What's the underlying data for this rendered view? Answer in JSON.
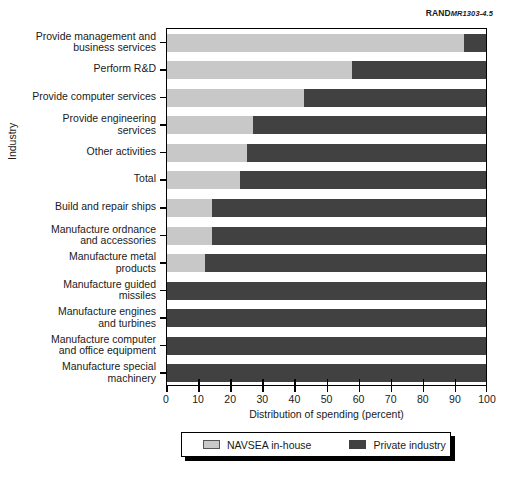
{
  "source_credit": {
    "publisher": "RAND",
    "document_id": "MR1303-4.5"
  },
  "chart_data": {
    "type": "bar",
    "orientation": "horizontal",
    "stacked": true,
    "title": "",
    "xlabel": "Distribution of spending (percent)",
    "ylabel": "Industry",
    "xlim": [
      0,
      100
    ],
    "xticks": [
      0,
      10,
      20,
      30,
      40,
      50,
      60,
      70,
      80,
      90,
      100
    ],
    "grid": false,
    "legend_position": "bottom",
    "categories": [
      "Provide management and business services",
      "Perform R&D",
      "Provide computer services",
      "Provide engineering services",
      "Other activities",
      "Total",
      "Build and repair ships",
      "Manufacture ordnance and accessories",
      "Manufacture metal products",
      "Manufacture guided missiles",
      "Manufacture engines and turbines",
      "Manufacture computer and office equipment",
      "Manufacture special machinery"
    ],
    "category_lines": [
      [
        "Provide management and",
        "business services"
      ],
      [
        "Perform R&D"
      ],
      [
        "Provide computer services"
      ],
      [
        "Provide engineering",
        "services"
      ],
      [
        "Other activities"
      ],
      [
        "Total"
      ],
      [
        "Build and repair ships"
      ],
      [
        "Manufacture ordnance",
        "and accessories"
      ],
      [
        "Manufacture metal products"
      ],
      [
        "Manufacture guided",
        "missiles"
      ],
      [
        "Manufacture engines",
        "and turbines"
      ],
      [
        "Manufacture computer",
        "and office equipment"
      ],
      [
        "Manufacture special",
        "machinery"
      ]
    ],
    "series": [
      {
        "name": "NAVSEA in-house",
        "color": "#c8c8c8",
        "values": [
          93,
          58,
          43,
          27,
          25,
          23,
          14,
          14,
          12,
          0,
          0,
          0,
          0
        ]
      },
      {
        "name": "Private industry",
        "color": "#414141",
        "values": [
          7,
          42,
          57,
          73,
          75,
          77,
          86,
          86,
          88,
          100,
          100,
          100,
          100
        ]
      }
    ]
  },
  "legend": {
    "items": [
      {
        "label": "NAVSEA in-house",
        "swatch": "inhouse"
      },
      {
        "label": "Private industry",
        "swatch": "private"
      }
    ]
  }
}
